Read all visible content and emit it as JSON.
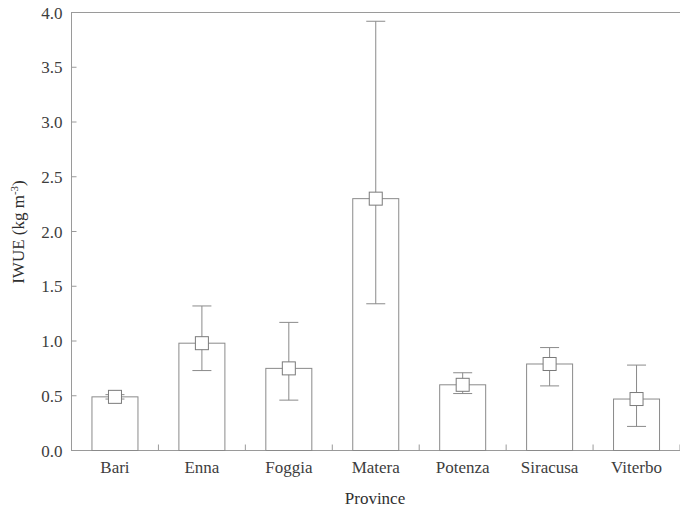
{
  "chart_data": {
    "type": "bar",
    "title": "",
    "xlabel": "Province",
    "ylabel": "IWUE (kg m",
    "ylabel_exponent": "-3",
    "ylabel_suffix": ")",
    "categories": [
      "Bari",
      "Enna",
      "Foggia",
      "Matera",
      "Potenza",
      "Siracusa",
      "Viterbo"
    ],
    "values": [
      0.49,
      0.98,
      0.75,
      2.3,
      0.6,
      0.79,
      0.47
    ],
    "error_upper": [
      0.51,
      1.32,
      1.17,
      3.92,
      0.71,
      0.94,
      0.78
    ],
    "error_lower": [
      0.47,
      0.73,
      0.46,
      1.34,
      0.52,
      0.59,
      0.22
    ],
    "ylim": [
      0.0,
      4.0
    ],
    "ytick_values": [
      0.0,
      0.5,
      1.0,
      1.5,
      2.0,
      2.5,
      3.0,
      3.5,
      4.0
    ],
    "ytick_labels": [
      "0.0",
      "0.5",
      "1.0",
      "1.5",
      "2.0",
      "2.5",
      "3.0",
      "3.5",
      "4.0"
    ],
    "grid": false,
    "legend": "none",
    "marker": "open-square",
    "bar_fill": "#ffffff",
    "bar_stroke": "#8a8a8a",
    "axis_color": "#9a9a9a",
    "text_color": "#3d3d3d"
  }
}
